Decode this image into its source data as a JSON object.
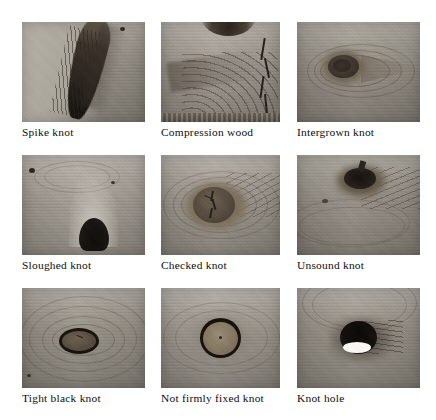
{
  "figure": {
    "type": "photo-grid",
    "columns": 3,
    "rows": 3,
    "background_color": "#ffffff",
    "caption_color": "#0c0c0c"
  },
  "cells": [
    {
      "id": "spike-knot",
      "caption": "Spike knot",
      "defect": "spike knot",
      "description": "elongated dark knot running diagonally from upper right to lower left on pale wood",
      "has_bottom_edge_band": true,
      "wood_tone": "#a8a299",
      "knot_color": "#4a4038"
    },
    {
      "id": "compression-wood",
      "caption": "Compression wood",
      "defect": "compression wood",
      "description": "dense curved grain with a vertical crack at the right and dark speckled board edge at bottom",
      "has_bottom_edge_band": true,
      "wood_tone": "#b0aaa1",
      "knot_color": "#554c41"
    },
    {
      "id": "intergrown-knot",
      "caption": "Intergrown knot",
      "defect": "intergrown knot",
      "description": "oval dark knot with grain flowing smoothly around it to a point at the right",
      "has_bottom_edge_band": false,
      "wood_tone": "#a5a096",
      "knot_color": "#4f463c"
    },
    {
      "id": "sloughed-knot",
      "caption": "Sloughed knot",
      "defect": "sloughed knot",
      "description": "very dark rounded knot sitting on the lower board edge with a pale halo above it",
      "has_bottom_edge_band": true,
      "wood_tone": "#b4aea5",
      "knot_color": "#1b1713"
    },
    {
      "id": "checked-knot",
      "caption": "Checked knot",
      "defect": "checked knot",
      "description": "large oval knot with a jagged check (crack) through its centre and swirling grain around it",
      "has_bottom_edge_band": true,
      "wood_tone": "#b0aaa1",
      "knot_color": "#5d5245"
    },
    {
      "id": "unsound-knot",
      "caption": "Unsound knot",
      "defect": "unsound knot",
      "description": "dark decayed knot near the top with fine grain lines radiating to the right",
      "has_bottom_edge_band": false,
      "wood_tone": "#a5a096",
      "knot_color": "#2a241d"
    },
    {
      "id": "tight-black-knot",
      "caption": "Tight black knot",
      "defect": "tight black knot",
      "description": "oval knot with a solid black ring, tightly held, concentric grain around it",
      "has_bottom_edge_band": true,
      "wood_tone": "#a8a299",
      "knot_color": "#554a3e"
    },
    {
      "id": "not-firmly-fixed-knot",
      "caption": "Not firmly fixed knot",
      "defect": "not firmly fixed knot",
      "description": "round knot outlined by a heavy black gap ring showing it is loose in the board",
      "has_bottom_edge_band": true,
      "wood_tone": "#b0aaa1",
      "knot_color": "#7a6e5e"
    },
    {
      "id": "knot-hole",
      "caption": "Knot hole",
      "defect": "knot hole",
      "description": "black void where the knot fell out, with a bright white lens of light at the bottom of the hole",
      "has_bottom_edge_band": true,
      "wood_tone": "#a8a299",
      "knot_color": "#100d0a",
      "highlight_color": "#fbfaf6"
    }
  ]
}
